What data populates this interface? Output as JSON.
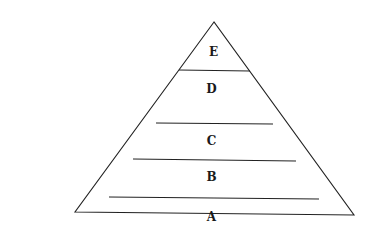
{
  "diagram": {
    "type": "pyramid",
    "levels_top_to_bottom": [
      {
        "label": "E"
      },
      {
        "label": "D"
      },
      {
        "label": "C"
      },
      {
        "label": "B"
      },
      {
        "label": "A"
      }
    ]
  }
}
